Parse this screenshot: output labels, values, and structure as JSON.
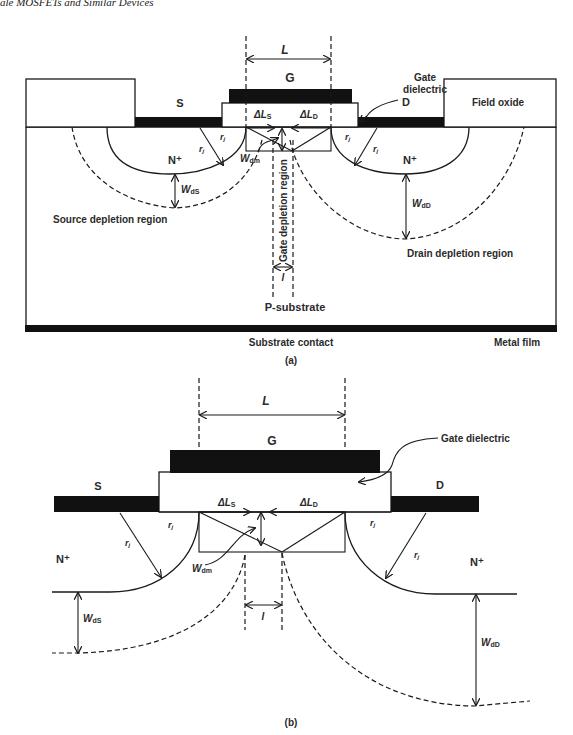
{
  "header": {
    "running_title": "ale MOSFETs and Similar Devices"
  },
  "figure_a": {
    "caption": "(a)",
    "labels": {
      "L": "L",
      "gate": "G",
      "gate_dielectric_line1": "Gate",
      "gate_dielectric_line2": "dielectric",
      "source": "S",
      "drain": "D",
      "field_oxide": "Field oxide",
      "delta_ls": "ΔL",
      "delta_ls_sub": "S",
      "delta_ld": "ΔL",
      "delta_ld_sub": "D",
      "rj": "r",
      "rj_sub": "j",
      "n_plus": "N⁺",
      "wdm": "W",
      "wdm_sub": "dm",
      "wds": "W",
      "wds_sub": "dS",
      "wdd": "W",
      "wdd_sub": "dD",
      "gate_depletion_region": "Gate depletion region",
      "source_depletion_region": "Source depletion region",
      "drain_depletion_region": "Drain depletion region",
      "l": "l",
      "p_substrate": "P-substrate",
      "substrate_contact": "Substrate contact",
      "metal_film": "Metal film"
    }
  },
  "figure_b": {
    "caption": "(b)",
    "labels": {
      "L": "L",
      "gate": "G",
      "gate_dielectric": "Gate dielectric",
      "source": "S",
      "drain": "D",
      "delta_ls": "ΔL",
      "delta_ls_sub": "S",
      "delta_ld": "ΔL",
      "delta_ld_sub": "D",
      "rj": "r",
      "rj_sub": "j",
      "n_plus": "N⁺",
      "wdm": "W",
      "wdm_sub": "dm",
      "wds": "W",
      "wds_sub": "dS",
      "wdd": "W",
      "wdd_sub": "dD",
      "l": "l"
    }
  },
  "colors": {
    "metal": "#111111",
    "line": "#1a1a1a",
    "background": "#ffffff"
  }
}
